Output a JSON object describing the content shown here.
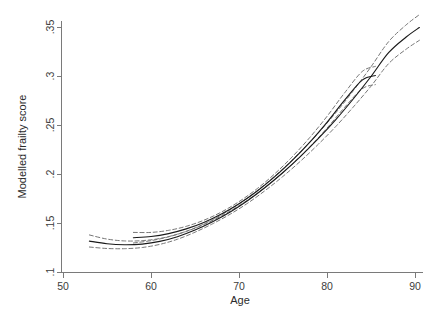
{
  "chart_data": {
    "type": "line",
    "title": "",
    "subtitle": "",
    "xlabel": "Age",
    "ylabel": "Modelled frailty score",
    "xlim": [
      50,
      91
    ],
    "ylim": [
      0.1,
      0.355
    ],
    "grid": false,
    "legend": "none",
    "annotations": [],
    "xticks": [
      50,
      60,
      70,
      80,
      90
    ],
    "xtick_labels": [
      "50",
      "60",
      "70",
      "80",
      "90"
    ],
    "yticks": [
      0.1,
      0.15,
      0.2,
      0.25,
      0.3,
      0.35
    ],
    "ytick_labels": [
      ".1",
      ".15",
      ".2",
      ".25",
      ".3",
      ".35"
    ],
    "series": [
      {
        "name": "Fitted frailty (cohort A)",
        "style": "solid",
        "color": "#1a1a1a",
        "x": [
          53.0,
          55.0,
          57.0,
          59.0,
          61.0,
          63.0,
          65.0,
          67.0,
          69.0,
          71.0,
          73.0,
          75.0,
          77.0,
          79.0,
          81.0,
          83.0,
          85.0,
          87.0,
          89.0,
          90.5
        ],
        "values": [
          0.1315,
          0.1288,
          0.1278,
          0.1285,
          0.1312,
          0.136,
          0.1428,
          0.1513,
          0.1613,
          0.173,
          0.1865,
          0.2015,
          0.218,
          0.236,
          0.2555,
          0.2768,
          0.2995,
          0.3238,
          0.3398,
          0.3495
        ]
      },
      {
        "name": "Upper 95% CI (cohort A)",
        "style": "dashed",
        "color": "#6f6f6f",
        "x": [
          53.0,
          55.0,
          57.0,
          59.0,
          61.0,
          63.0,
          65.0,
          67.0,
          69.0,
          71.0,
          73.0,
          75.0,
          77.0,
          79.0,
          81.0,
          83.0,
          85.0,
          87.0,
          89.0,
          90.5
        ],
        "values": [
          0.1378,
          0.1336,
          0.1317,
          0.132,
          0.1342,
          0.1386,
          0.145,
          0.1534,
          0.1636,
          0.1757,
          0.1897,
          0.2054,
          0.2228,
          0.2418,
          0.2625,
          0.2851,
          0.3094,
          0.335,
          0.3522,
          0.3626
        ]
      },
      {
        "name": "Lower 95% CI (cohort A)",
        "style": "dashed",
        "color": "#6f6f6f",
        "x": [
          53.0,
          55.0,
          57.0,
          59.0,
          61.0,
          63.0,
          65.0,
          67.0,
          69.0,
          71.0,
          73.0,
          75.0,
          77.0,
          79.0,
          81.0,
          83.0,
          85.0,
          87.0,
          89.0,
          90.5
        ],
        "values": [
          0.1255,
          0.124,
          0.1238,
          0.125,
          0.1282,
          0.1334,
          0.1406,
          0.1492,
          0.159,
          0.1703,
          0.1833,
          0.1976,
          0.2132,
          0.2302,
          0.2485,
          0.2685,
          0.2896,
          0.3126,
          0.3274,
          0.3364
        ]
      },
      {
        "name": "Fitted frailty (cohort B)",
        "style": "solid",
        "color": "#1a1a1a",
        "x": [
          58.0,
          60.0,
          62.0,
          64.0,
          66.0,
          68.0,
          70.0,
          72.0,
          74.0,
          76.0,
          78.0,
          80.0,
          82.0,
          84.0,
          85.5
        ],
        "values": [
          0.135,
          0.1362,
          0.1392,
          0.144,
          0.1506,
          0.1592,
          0.1697,
          0.1822,
          0.1968,
          0.2134,
          0.232,
          0.2528,
          0.2754,
          0.2958,
          0.3005
        ]
      },
      {
        "name": "Upper 95% CI (cohort B)",
        "style": "dashed",
        "color": "#6f6f6f",
        "x": [
          58.0,
          60.0,
          62.0,
          64.0,
          66.0,
          68.0,
          70.0,
          72.0,
          74.0,
          76.0,
          78.0,
          80.0,
          82.0,
          84.0,
          85.5
        ],
        "values": [
          0.1404,
          0.1404,
          0.1425,
          0.1466,
          0.1528,
          0.1612,
          0.1718,
          0.1846,
          0.1997,
          0.2171,
          0.2368,
          0.2588,
          0.2828,
          0.3046,
          0.3098
        ]
      },
      {
        "name": "Lower 95% CI (cohort B)",
        "style": "dashed",
        "color": "#6f6f6f",
        "x": [
          58.0,
          60.0,
          62.0,
          64.0,
          66.0,
          68.0,
          70.0,
          72.0,
          74.0,
          76.0,
          78.0,
          80.0,
          82.0,
          84.0,
          85.5
        ],
        "values": [
          0.1296,
          0.132,
          0.1359,
          0.1414,
          0.1484,
          0.1572,
          0.1676,
          0.1798,
          0.1939,
          0.2097,
          0.2272,
          0.2468,
          0.268,
          0.287,
          0.2912
        ]
      }
    ]
  },
  "axes": {
    "x_title": "Age",
    "y_title": "Modelled frailty score"
  }
}
